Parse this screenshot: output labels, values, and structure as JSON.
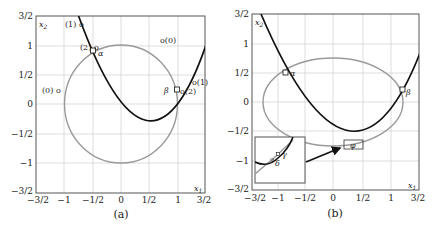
{
  "figure": {
    "panels": [
      {
        "id": "a",
        "caption": "(a)",
        "x_axis_label": "x1",
        "y_axis_label": "x2",
        "x_ticks": [
          "−3/2",
          "−1",
          "−1/2",
          "0",
          "1/2",
          "1",
          "3/2"
        ],
        "y_ticks": [
          "3/2",
          "1",
          "1/2",
          "0",
          "−1/2",
          "−1",
          "−3/2"
        ],
        "curves": [
          {
            "name": "parabola",
            "equation": "x2 = (x1 - 1/2)^2",
            "color": "#111111"
          },
          {
            "name": "unit-circle",
            "equation": "x1^2 + x2^2 = 1",
            "color": "#9a9a9a"
          }
        ],
        "markers": [
          {
            "label": "α",
            "x": -0.5,
            "y": 0.9
          },
          {
            "label": "β",
            "x": 0.95,
            "y": 0.3
          }
        ],
        "annotations": [
          {
            "text": "(1) o",
            "x": -0.95,
            "y": 1.38
          },
          {
            "text": "(2) o",
            "x": -0.68,
            "y": 0.98
          },
          {
            "text": "(0) o",
            "x": -1.38,
            "y": 0.45
          },
          {
            "text": "o(0)",
            "x": 0.75,
            "y": 1.1
          },
          {
            "text": "o(1)",
            "x": 1.25,
            "y": 0.58
          },
          {
            "text": "o(2)",
            "x": 1.0,
            "y": 0.2
          },
          {
            "text": "α",
            "x": -0.4,
            "y": 0.85
          },
          {
            "text": "β",
            "x": 0.76,
            "y": 0.35
          }
        ]
      },
      {
        "id": "b",
        "caption": "(b)",
        "x_axis_label": "x1",
        "y_axis_label": "x2",
        "x_ticks": [
          "−3/2",
          "−1",
          "−1/2",
          "0",
          "1/2",
          "1",
          "3/2"
        ],
        "y_ticks": [
          "3/2",
          "1",
          "1/2",
          "0",
          "−1/2",
          "−1",
          "−3/2"
        ],
        "curves": [
          {
            "name": "parabola",
            "color": "#111111"
          },
          {
            "name": "ellipse",
            "color": "#9a9a9a"
          }
        ],
        "markers": [
          {
            "label": "α",
            "x": -0.8,
            "y": 0.5
          },
          {
            "label": "β",
            "x": 1.4,
            "y": 0.25
          },
          {
            "label": "φ",
            "x": 0.55,
            "y": -0.72
          }
        ],
        "inset": {
          "labels": [
            "γ",
            "δ"
          ],
          "arrow": "points-to-φ-box"
        }
      }
    ]
  }
}
